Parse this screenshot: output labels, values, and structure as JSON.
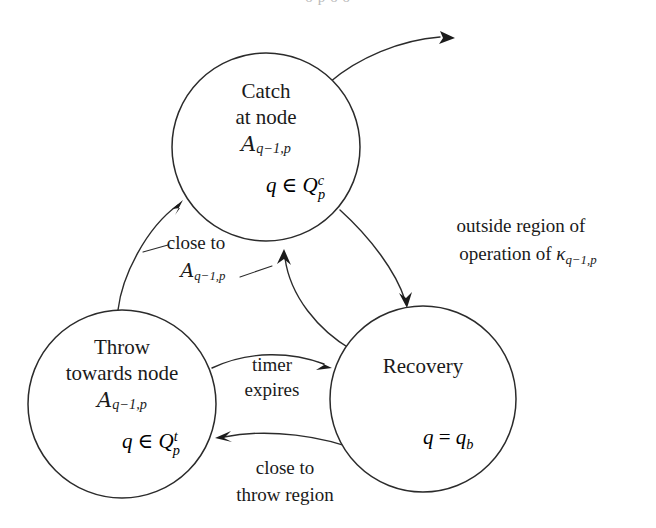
{
  "figure": {
    "type": "state-transition-diagram",
    "width": 656,
    "height": 528,
    "background_color": "#ffffff",
    "stroke_color": "#2b2b2b",
    "text_color": "#1a1a1a",
    "clipped_caption_top": "o p o o"
  },
  "states": [
    {
      "id": "catch",
      "name": "Catch at node",
      "line1": "Catch",
      "line2": "at node",
      "node_symbol": "A",
      "node_subscript": "q−1,p",
      "condition_var": "q",
      "condition_rel": "∈",
      "condition_set": "Q",
      "condition_set_sub": "p",
      "condition_set_sup": "c",
      "cx": 266,
      "cy": 147,
      "r": 94
    },
    {
      "id": "throw",
      "name": "Throw towards node",
      "line1": "Throw",
      "line2": "towards node",
      "node_symbol": "A",
      "node_subscript": "q−1,p",
      "condition_var": "q",
      "condition_rel": "∈",
      "condition_set": "Q",
      "condition_set_sub": "p",
      "condition_set_sup": "t",
      "cx": 122,
      "cy": 404,
      "r": 94
    },
    {
      "id": "recovery",
      "name": "Recovery",
      "line1": "Recovery",
      "line2": "",
      "node_symbol": "",
      "node_subscript": "",
      "condition_var": "q",
      "condition_rel": "=",
      "condition_set": "q",
      "condition_set_sub": "b",
      "condition_set_sup": "",
      "cx": 423,
      "cy": 399,
      "r": 93
    }
  ],
  "transitions": [
    {
      "id": "throw-to-catch",
      "from": "throw",
      "to": "catch",
      "label_line1": "close to",
      "label_symbol": "A",
      "label_subscript": "q−1,p",
      "label_x": 196,
      "label_y": 244
    },
    {
      "id": "catch-to-recovery",
      "from": "catch",
      "to": "recovery",
      "label_line1": "outside region of",
      "label_line2": "operation of",
      "label_symbol": "κ",
      "label_subscript": "q−1,p",
      "label_x": 521,
      "label_y": 232
    },
    {
      "id": "throw-to-recovery",
      "from": "throw",
      "to": "recovery",
      "label_line1": "timer",
      "label_line2": "expires",
      "label_x": 272,
      "label_y": 378
    },
    {
      "id": "recovery-to-throw",
      "from": "recovery",
      "to": "throw",
      "label_line1": "close to",
      "label_line2": "throw region",
      "label_x": 285,
      "label_y": 477
    },
    {
      "id": "recovery-to-catch",
      "from": "recovery",
      "to": "catch",
      "label_line1": "",
      "label_line2": "",
      "label_x": 0,
      "label_y": 0
    },
    {
      "id": "catch-exit",
      "from": "catch",
      "to": "external",
      "label_line1": "",
      "label_line2": "",
      "label_x": 0,
      "label_y": 0
    }
  ]
}
